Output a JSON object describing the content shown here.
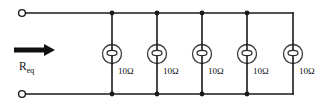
{
  "figure": {
    "width": 323,
    "height": 108,
    "background": "#ffffff",
    "line_color": "#1a1a1a"
  },
  "labels": {
    "equivalent_resistance": "R",
    "equivalent_resistance_subscript": "eq"
  },
  "circuit": {
    "type": "parallel-resistor-network",
    "rail_top_y": 13,
    "rail_bottom_y": 94,
    "rail_left_x": 28,
    "rail_right_x": 293,
    "terminal_top": {
      "x": 22,
      "y": 13,
      "radius": 3.4
    },
    "terminal_bottom": {
      "x": 22,
      "y": 94,
      "radius": 3.4
    },
    "branches": [
      {
        "id": "branch-1",
        "x": 112,
        "label": "10Ω",
        "value": 10,
        "unit": "Ω",
        "junction_top": true,
        "junction_bottom": true
      },
      {
        "id": "branch-2",
        "x": 157,
        "label": "10Ω",
        "value": 10,
        "unit": "Ω",
        "junction_top": true,
        "junction_bottom": true
      },
      {
        "id": "branch-3",
        "x": 202,
        "label": "10Ω",
        "value": 10,
        "unit": "Ω",
        "junction_top": true,
        "junction_bottom": true
      },
      {
        "id": "branch-4",
        "x": 247,
        "label": "10Ω",
        "value": 10,
        "unit": "Ω",
        "junction_top": true,
        "junction_bottom": true
      },
      {
        "id": "branch-5",
        "x": 293,
        "label": "10Ω",
        "value": 10,
        "unit": "Ω",
        "junction_top": false,
        "junction_bottom": false
      }
    ],
    "component_symbol": {
      "shape": "circle-with-ellipse",
      "circle_radius": 9.5,
      "ellipse_rx": 5,
      "ellipse_ry": 2.6,
      "center_y": 54
    },
    "arrow": {
      "x_start": 14,
      "x_end": 55,
      "y": 50,
      "direction": "right",
      "thickness": 4
    }
  }
}
